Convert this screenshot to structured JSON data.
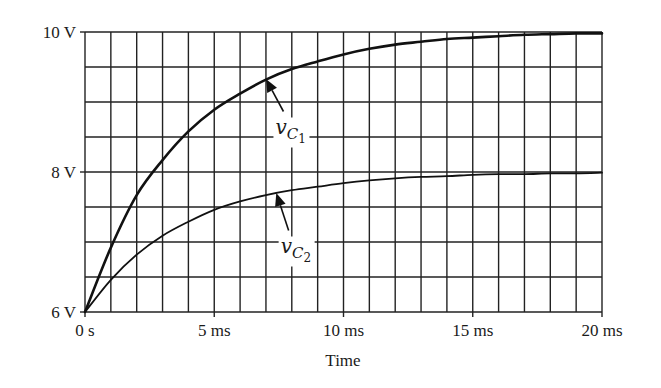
{
  "chart_data": {
    "type": "line",
    "title": "",
    "xlabel": "Time",
    "ylabel": "",
    "xlim": [
      0,
      20
    ],
    "ylim": [
      6,
      10
    ],
    "x_unit": "ms",
    "grid": true,
    "grid_x_step": 1,
    "grid_y_step": 0.5,
    "x_ticks": [
      {
        "value": 0,
        "label": "0 s"
      },
      {
        "value": 5,
        "label": "5 ms"
      },
      {
        "value": 10,
        "label": "10 ms"
      },
      {
        "value": 15,
        "label": "15 ms"
      },
      {
        "value": 20,
        "label": "20 ms"
      }
    ],
    "y_ticks": [
      {
        "value": 6,
        "label": "6 V"
      },
      {
        "value": 8,
        "label": "8 V"
      },
      {
        "value": 10,
        "label": "10 V"
      }
    ],
    "legend": null,
    "x": [
      0,
      1,
      2,
      3,
      4,
      5,
      6,
      7,
      8,
      9,
      10,
      11,
      12,
      13,
      14,
      15,
      16,
      17,
      18,
      19,
      20
    ],
    "series": [
      {
        "name": "v_C1",
        "label_main": "v",
        "label_sub": "C",
        "label_subsub": "1",
        "stroke_width": 2.6,
        "values": [
          6.0,
          6.92,
          7.67,
          8.17,
          8.58,
          8.89,
          9.12,
          9.32,
          9.47,
          9.58,
          9.68,
          9.76,
          9.82,
          9.86,
          9.9,
          9.92,
          9.94,
          9.96,
          9.97,
          9.98,
          9.98
        ]
      },
      {
        "name": "v_C2",
        "label_main": "v",
        "label_sub": "C",
        "label_subsub": "2",
        "stroke_width": 1.8,
        "values": [
          6.0,
          6.46,
          6.82,
          7.09,
          7.29,
          7.46,
          7.58,
          7.67,
          7.74,
          7.79,
          7.84,
          7.88,
          7.91,
          7.93,
          7.94,
          7.96,
          7.97,
          7.97,
          7.98,
          7.98,
          7.99
        ]
      }
    ],
    "annotations": [
      {
        "series": "v_C1",
        "arrow_tip": [
          7.0,
          9.33
        ],
        "label_at": [
          7.6,
          8.55
        ]
      },
      {
        "series": "v_C2",
        "arrow_tip": [
          7.4,
          7.7
        ],
        "label_at": [
          7.8,
          6.85
        ]
      }
    ]
  }
}
